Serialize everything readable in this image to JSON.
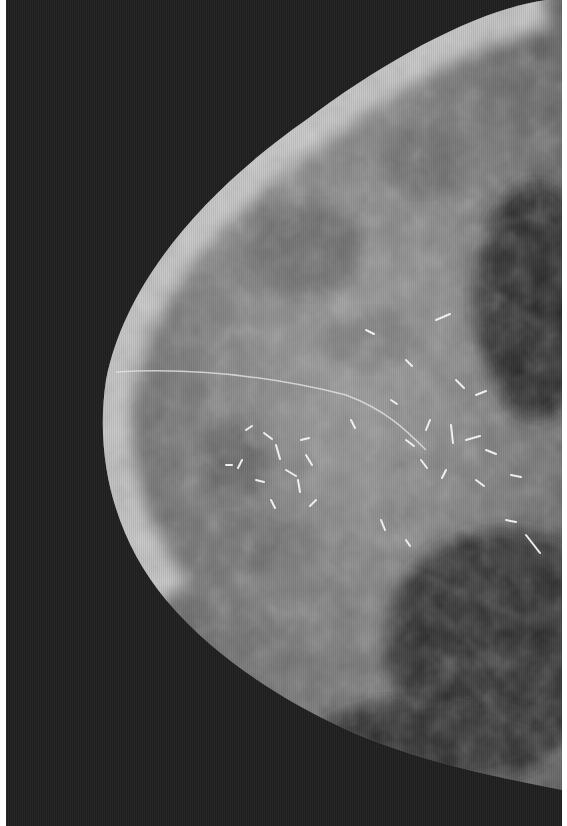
{
  "image": {
    "kind": "mammogram",
    "view": "mediolateral oblique (grayscale radiograph)",
    "description": "Breast tissue radiograph with dense fibroglandular tissue and clustered linear branching calcifications in the central region",
    "colors": {
      "background": "#1f1f1f",
      "border": "#ffffff",
      "skin_edge": "#d8d8d8",
      "parenchyma": "#8a8a8a",
      "calcifications": "#f2f2f2"
    }
  }
}
